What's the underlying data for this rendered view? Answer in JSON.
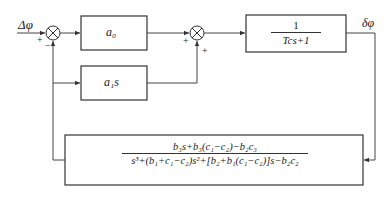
{
  "diagram": {
    "input_label": "Δφ",
    "output_label": "δφ",
    "sum1": {
      "signs": [
        "+",
        "−"
      ]
    },
    "sum2": {
      "signs": [
        "+",
        "+"
      ]
    },
    "blocks": {
      "a0": "a₀",
      "a1s": "a₁s",
      "plant": {
        "numerator": "1",
        "denominator": "Tcs+1"
      },
      "feedback": {
        "numerator": "b₃s+b₃(c₁−c₂)−b₂c₃",
        "denominator": "s³+(b₁+c₁−c₂)s²+[b₂+b₁(c₁−c₂)]s−b₂c₂"
      }
    }
  }
}
